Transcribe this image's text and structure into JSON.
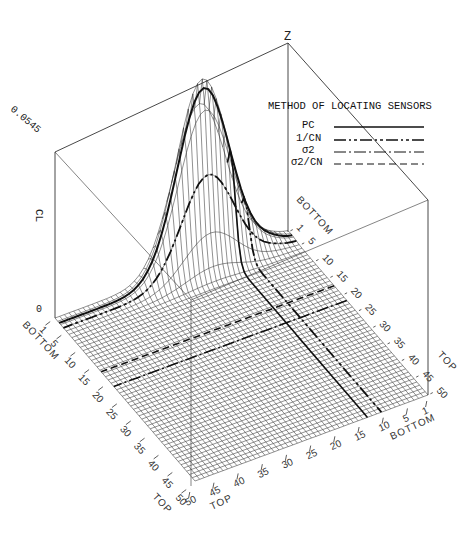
{
  "chart_data": {
    "type": "surface3d",
    "title": "",
    "z_axis": {
      "label": "Z",
      "name": "CL",
      "ticks": [
        "0",
        "0.0545"
      ],
      "range": [
        0,
        0.0545
      ]
    },
    "x_axis_left": {
      "start_label": "BOTTOM",
      "end_label": "TOP",
      "ticks": [
        "1",
        "5",
        "10",
        "15",
        "20",
        "25",
        "30",
        "35",
        "40",
        "45",
        "50"
      ],
      "range": [
        1,
        50
      ]
    },
    "y_axis_right": {
      "start_label": "BOTTOM",
      "end_label": "TOP",
      "ticks": [
        "1",
        "5",
        "10",
        "15",
        "20",
        "25",
        "30",
        "35",
        "40",
        "45",
        "50"
      ],
      "range": [
        1,
        50
      ]
    },
    "legend": {
      "title": "METHOD OF LOCATING SENSORS",
      "position": "upper-right",
      "entries": [
        {
          "label": "PC",
          "style": "solid"
        },
        {
          "label": "1/CN",
          "style": "dash-dot-dot-heavy"
        },
        {
          "label": "σ2",
          "style": "dash-dot"
        },
        {
          "label": "σ2/CN",
          "style": "dashed"
        }
      ]
    },
    "surface": {
      "description": "Mesh surface with a single sharp ridge/peak near the BOTTOM end of the right axis (~index 1-5) rising to the max z value 0.0545; flat elsewhere",
      "peak_value": 0.0545,
      "grid": "50x50"
    },
    "grid": true
  },
  "labels": {
    "z_top": "Z",
    "z_max": "0.0545",
    "z_zero": "0",
    "z_name": "CL",
    "legend_title": "METHOD OF LOCATING SENSORS",
    "legend_pc": "PC",
    "legend_1cn": "1/CN",
    "legend_s2": "σ2",
    "legend_s2cn": "σ2/CN",
    "left_bottom": "BOTTOM",
    "left_top": "TOP",
    "right_bottom": "BOTTOM",
    "right_top": "TOP",
    "back_bottom": "BOTTOM",
    "back_top": "TOP",
    "front_top": "TOP"
  }
}
